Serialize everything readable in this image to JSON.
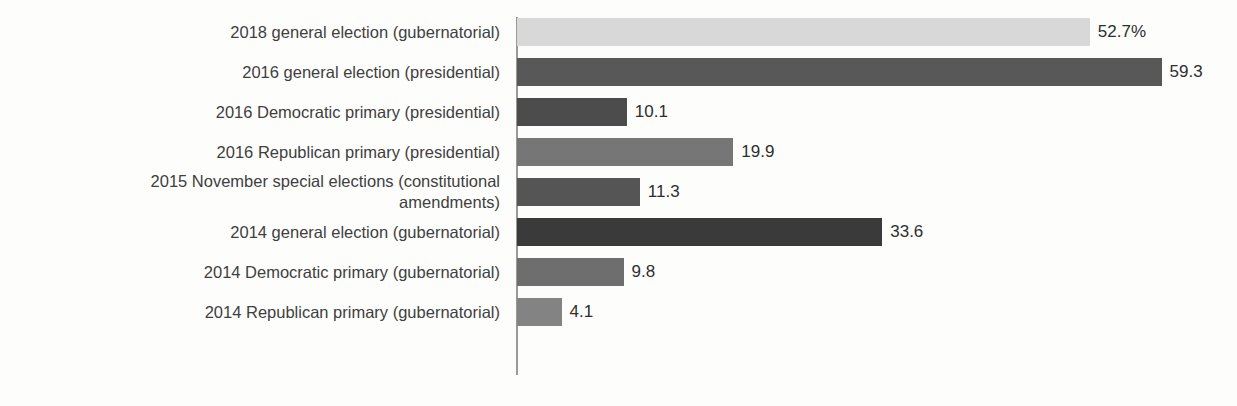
{
  "chart_data": {
    "type": "bar",
    "orientation": "horizontal",
    "title": "",
    "subtitle": "",
    "xlabel": "",
    "ylabel": "",
    "grid": false,
    "legend": null,
    "axis_visible": true,
    "xlim": [
      0,
      66
    ],
    "unit": "%",
    "categories": [
      "2018 general election (gubernatorial)",
      "2016 general election (presidential)",
      "2016 Democratic primary (presidential)",
      "2016 Republican primary (presidential)",
      "2015 November special elections (constitutional\namendments)",
      "2014 general election (gubernatorial)",
      "2014 Democratic primary (gubernatorial)",
      "2014 Republican primary (gubernatorial)"
    ],
    "values": [
      52.7,
      59.3,
      10.1,
      19.9,
      11.3,
      33.6,
      9.8,
      4.1
    ],
    "value_labels": [
      "52.7%",
      "59.3",
      "10.1",
      "19.9",
      "11.3",
      "33.6",
      "9.8",
      "4.1"
    ],
    "bar_colors": [
      "#d8d8d8",
      "#585858",
      "#4c4c4c",
      "#767676",
      "#555555",
      "#3a3a3a",
      "#6e6e6e",
      "#838383"
    ]
  },
  "style": {
    "background": "#fdfdfc",
    "axis_color": "#9a9a9a",
    "label_color": "#3f3f3f",
    "value_color": "#2e2e2e"
  }
}
